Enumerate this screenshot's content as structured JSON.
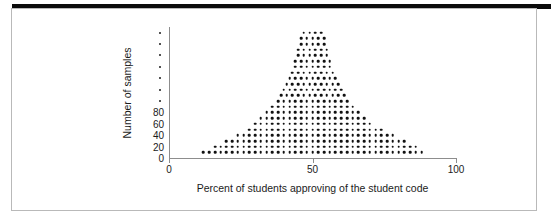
{
  "figure": {
    "y_axis_title": "Number of samples",
    "x_axis_title": "Percent of students approving of the student code"
  },
  "chart_data": {
    "type": "scatter",
    "title": "",
    "subtitle": "",
    "xlabel": "Percent of students approving of the student code",
    "ylabel": "Number of samples",
    "xlim": [
      0,
      100
    ],
    "ylim": [
      0,
      230
    ],
    "grid": false,
    "legend": null,
    "x_tick_labels": [
      "0",
      "50",
      "100"
    ],
    "x_ticks": [
      0,
      50,
      100
    ],
    "y_tick_labels": [
      "0",
      "20",
      "40",
      "60",
      "80"
    ],
    "y_ticks_labeled": [
      0,
      20,
      40,
      60,
      80
    ],
    "y_ticks_unlabeled": [
      100,
      120,
      140,
      160,
      180,
      200,
      220
    ],
    "dot_row_spacing_y": 10,
    "dot_row_spacing_x": 2,
    "rows": [
      {
        "y": 10,
        "x_start": 12,
        "x_end": 88
      },
      {
        "y": 20,
        "x_start": 16,
        "x_end": 86
      },
      {
        "y": 30,
        "x_start": 20,
        "x_end": 82
      },
      {
        "y": 40,
        "x_start": 24,
        "x_end": 78
      },
      {
        "y": 50,
        "x_start": 28,
        "x_end": 74
      },
      {
        "y": 60,
        "x_start": 30,
        "x_end": 70
      },
      {
        "y": 70,
        "x_start": 32,
        "x_end": 68
      },
      {
        "y": 80,
        "x_start": 34,
        "x_end": 66
      },
      {
        "y": 90,
        "x_start": 36,
        "x_end": 64
      },
      {
        "y": 100,
        "x_start": 38,
        "x_end": 63
      },
      {
        "y": 110,
        "x_start": 39,
        "x_end": 62
      },
      {
        "y": 120,
        "x_start": 40,
        "x_end": 61
      },
      {
        "y": 130,
        "x_start": 41,
        "x_end": 60
      },
      {
        "y": 140,
        "x_start": 42,
        "x_end": 59
      },
      {
        "y": 150,
        "x_start": 43,
        "x_end": 58
      },
      {
        "y": 160,
        "x_start": 44,
        "x_end": 57
      },
      {
        "y": 170,
        "x_start": 44,
        "x_end": 56
      },
      {
        "y": 180,
        "x_start": 45,
        "x_end": 56
      },
      {
        "y": 190,
        "x_start": 45,
        "x_end": 55
      },
      {
        "y": 200,
        "x_start": 46,
        "x_end": 55
      },
      {
        "y": 210,
        "x_start": 46,
        "x_end": 54
      },
      {
        "y": 220,
        "x_start": 47,
        "x_end": 53
      }
    ]
  }
}
